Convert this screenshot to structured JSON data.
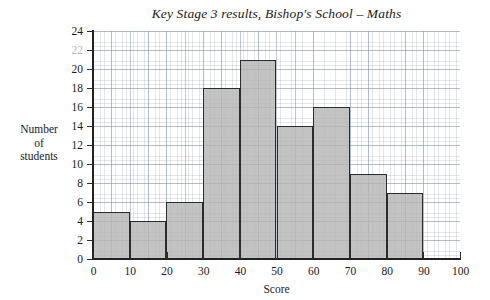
{
  "chart_data": {
    "type": "bar",
    "title": "Key Stage 3 results, Bishop's School – Maths",
    "xlabel": "Score",
    "ylabel": "Number of students",
    "ylabel_lines": [
      "Number",
      "of",
      "students"
    ],
    "categories": [
      "0–10",
      "10–20",
      "20–30",
      "30–40",
      "40–50",
      "50–60",
      "60–70",
      "70–80",
      "80–90"
    ],
    "bin_edges": [
      0,
      10,
      20,
      30,
      40,
      50,
      60,
      70,
      80,
      90
    ],
    "values": [
      5,
      4,
      6,
      18,
      21,
      14,
      16,
      9,
      7
    ],
    "xlim": [
      0,
      100
    ],
    "ylim": [
      0,
      24
    ],
    "xticks": [
      0,
      10,
      20,
      30,
      40,
      50,
      60,
      70,
      80,
      90,
      100
    ],
    "yticks": [
      0,
      2,
      4,
      6,
      8,
      10,
      12,
      14,
      16,
      18,
      20,
      22,
      24
    ],
    "xtick_labels": [
      "0",
      "10",
      "20",
      "30",
      "40",
      "50",
      "60",
      "70",
      "80",
      "90",
      "100"
    ],
    "ytick_labels": [
      "0",
      "2",
      "4",
      "6",
      "8",
      "10",
      "12",
      "14",
      "16",
      "18",
      "20",
      "22",
      "24"
    ],
    "faded_ytick_labels": [
      "22"
    ],
    "grid": true,
    "grid_style": "graph-paper",
    "legend": null,
    "bar_fill_color": "#b4b4b4",
    "bar_edge_color": "#2b2b2b",
    "grid_color": "#8794a5",
    "axis_color": "#222222",
    "background_color": "#ffffff"
  }
}
